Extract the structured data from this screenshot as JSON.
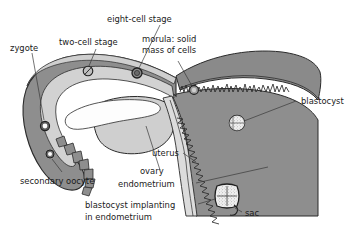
{
  "figure": {
    "type": "anatomical-diagram"
  },
  "colors": {
    "wall_dark": "#8e8e8e",
    "wall_mid": "#9a9a9a",
    "lumen_light": "#d8d8d8",
    "ovary_light": "#cfcfcf",
    "cavity_white": "#fdfdfd",
    "outline": "#2b2b2b",
    "text": "#1a1a1a",
    "leader": "#3a3a3a",
    "background": "#ffffff"
  },
  "labels": {
    "zygote": "zygote",
    "two_cell": "two-cell stage",
    "eight_cell": "eight-cell stage",
    "morula_line1": "morula: solid",
    "morula_line2": "mass of cells",
    "blastocyst": "blastocyst",
    "uterus": "uterus",
    "ovary": "ovary",
    "endometrium": "endometrium",
    "secondary_oocyte": "secondary oocyte",
    "implanting_line1": "blastocyst implanting",
    "implanting_line2": "in endometrium",
    "sac": "sac"
  },
  "structures": [
    {
      "name": "fallopian-tube",
      "label_key": "zygote"
    },
    {
      "name": "ovary",
      "label_key": "ovary"
    },
    {
      "name": "uterus",
      "label_key": "uterus"
    },
    {
      "name": "endometrium",
      "label_key": "endometrium"
    },
    {
      "name": "fimbriae",
      "label_key": "secondary_oocyte"
    }
  ],
  "developmental_stages": [
    {
      "name": "secondary-oocyte",
      "order": 1,
      "label_key": "secondary_oocyte",
      "cx": 50,
      "cy": 154,
      "r": 4.0
    },
    {
      "name": "zygote",
      "order": 2,
      "label_key": "zygote",
      "cx": 45,
      "cy": 126,
      "r": 4.6
    },
    {
      "name": "two-cell-stage",
      "order": 3,
      "label_key": "two_cell",
      "cx": 88,
      "cy": 71,
      "r": 4.8
    },
    {
      "name": "eight-cell-stage",
      "order": 4,
      "label_key": "eight_cell",
      "cx": 137,
      "cy": 73,
      "r": 5.0
    },
    {
      "name": "morula",
      "order": 5,
      "label_key": "morula_line1",
      "cx": 194,
      "cy": 90,
      "r": 4.4
    },
    {
      "name": "blastocyst",
      "order": 6,
      "label_key": "blastocyst",
      "cx": 237,
      "cy": 123,
      "r": 7.6
    },
    {
      "name": "implanting-blastocyst",
      "order": 7,
      "label_key": "implanting_line1",
      "cx": 227,
      "cy": 196,
      "r": 10.5
    }
  ]
}
